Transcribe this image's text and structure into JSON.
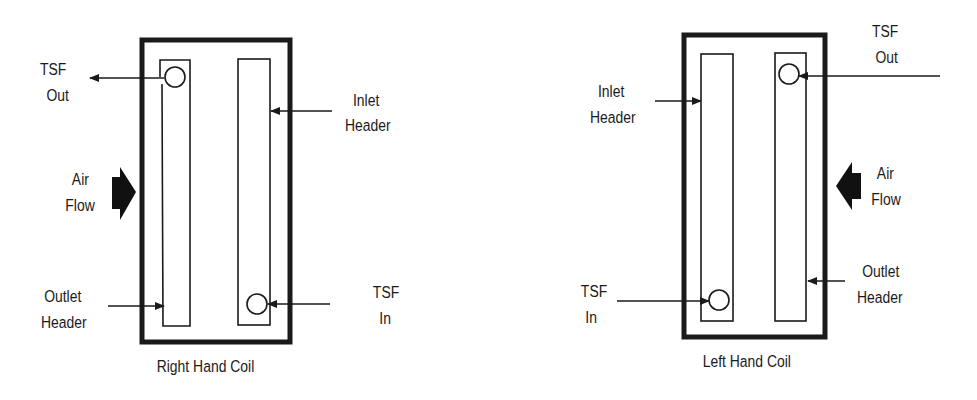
{
  "colors": {
    "ink": "#1a1a1a",
    "background": "#ffffff"
  },
  "diagrams": [
    {
      "title": "Right Hand Coil",
      "labels": {
        "tsf_out": [
          "TSF",
          "Out"
        ],
        "inlet_header": [
          "Inlet",
          "Header"
        ],
        "air_flow": [
          "Air",
          "Flow"
        ],
        "outlet_header": [
          "Outlet",
          "Header"
        ],
        "tsf_in": [
          "TSF",
          "In"
        ]
      },
      "air_flow_direction": "right"
    },
    {
      "title": "Left Hand Coil",
      "labels": {
        "inlet_header": [
          "Inlet",
          "Header"
        ],
        "tsf_out": [
          "TSF",
          "Out"
        ],
        "air_flow": [
          "Air",
          "Flow"
        ],
        "outlet_header": [
          "Outlet",
          "Header"
        ],
        "tsf_in": [
          "TSF",
          "In"
        ]
      },
      "air_flow_direction": "left"
    }
  ]
}
